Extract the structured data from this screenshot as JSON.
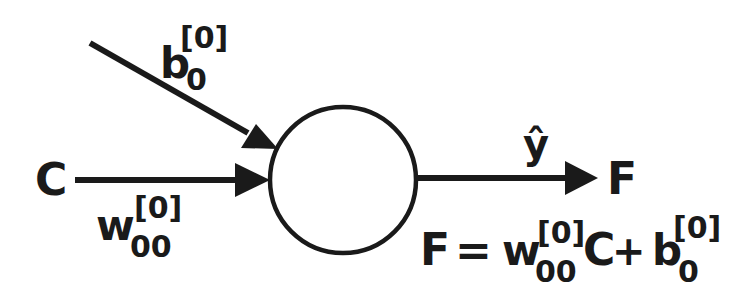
{
  "diagram": {
    "node": {
      "shape": "circle"
    },
    "inputs": [
      {
        "label": "C",
        "weight_base": "w",
        "weight_sub": "00",
        "weight_sup": "[0]"
      }
    ],
    "bias": {
      "base": "b",
      "sub": "0",
      "sup": "[0]"
    },
    "output": {
      "label": "F",
      "prediction": "ŷ"
    },
    "equation": {
      "lhs": "F",
      "equals": "=",
      "w_base": "w",
      "w_sub": "00",
      "w_sup": "[0]",
      "input": "C",
      "plus": "+",
      "b_base": "b",
      "b_sub": "0",
      "b_sup": "[0]"
    },
    "colors": {
      "stroke": "#1a1a1a",
      "background": "#ffffff"
    }
  }
}
